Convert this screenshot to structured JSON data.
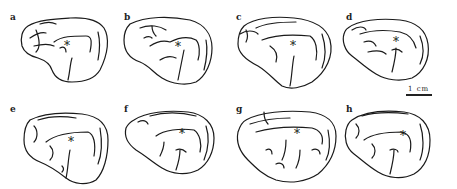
{
  "figure": {
    "panels": [
      {
        "label": "a",
        "marker": "*"
      },
      {
        "label": "b",
        "marker": "*"
      },
      {
        "label": "c",
        "marker": "*"
      },
      {
        "label": "d",
        "marker": "*"
      },
      {
        "label": "e",
        "marker": "*"
      },
      {
        "label": "f",
        "marker": "*"
      },
      {
        "label": "g",
        "marker": "*"
      },
      {
        "label": "h",
        "marker": "*"
      }
    ],
    "scale_bar": {
      "label": "1 cm"
    },
    "colors": {
      "ink": "#1a1a1a",
      "background": "#ffffff"
    }
  }
}
